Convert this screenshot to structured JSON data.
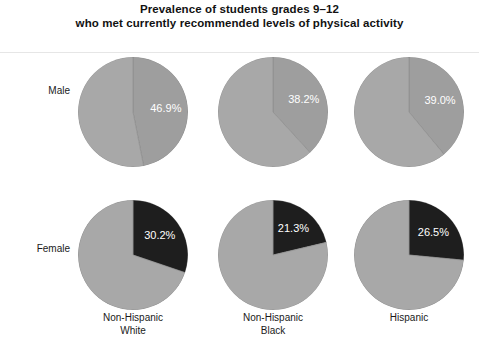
{
  "title": {
    "line1": "Prevalence of students grades 9–12",
    "line2": "who met currently recommended levels of physical activity"
  },
  "rows": [
    {
      "label": "Male"
    },
    {
      "label": "Female"
    }
  ],
  "columns": [
    {
      "line1": "Non-Hispanic",
      "line2": "White"
    },
    {
      "line1": "Non-Hispanic",
      "line2": "Black"
    },
    {
      "line1": "Hispanic",
      "line2": ""
    }
  ],
  "colors": {
    "slice_highlight_male": "#9e9e9e",
    "slice_highlight_female": "#1e1e1e",
    "slice_remainder": "#a8a8a8",
    "slice_outline": "#8a8a8a",
    "label_text": "#ffffff",
    "title_text": "#121212"
  },
  "cells": [
    {
      "row": "Male",
      "column": "Non-Hispanic White",
      "value_label": "46.9%"
    },
    {
      "row": "Male",
      "column": "Non-Hispanic Black",
      "value_label": "38.2%"
    },
    {
      "row": "Male",
      "column": "Hispanic",
      "value_label": "39.0%"
    },
    {
      "row": "Female",
      "column": "Non-Hispanic White",
      "value_label": "30.2%"
    },
    {
      "row": "Female",
      "column": "Non-Hispanic Black",
      "value_label": "21.3%"
    },
    {
      "row": "Female",
      "column": "Hispanic",
      "value_label": "26.5%"
    }
  ],
  "chart_data": {
    "type": "pie",
    "title": "Prevalence of students grades 9–12 who met currently recommended levels of physical activity",
    "subtitle": "",
    "xlabel": "",
    "ylabel": "",
    "units": "percent",
    "grid": false,
    "legend": "none",
    "layout": {
      "rows": 2,
      "cols": 3,
      "row_labels": [
        "Male",
        "Female"
      ],
      "col_labels": [
        "Non-Hispanic White",
        "Non-Hispanic Black",
        "Hispanic"
      ]
    },
    "panels": [
      {
        "row": "Male",
        "column": "Non-Hispanic White",
        "slices": [
          {
            "name": "Met recommended levels",
            "value": 46.9,
            "label": "46.9%",
            "color": "#9e9e9e"
          },
          {
            "name": "Did not meet",
            "value": 53.1,
            "label": "",
            "color": "#a8a8a8"
          }
        ]
      },
      {
        "row": "Male",
        "column": "Non-Hispanic Black",
        "slices": [
          {
            "name": "Met recommended levels",
            "value": 38.2,
            "label": "38.2%",
            "color": "#9e9e9e"
          },
          {
            "name": "Did not meet",
            "value": 61.8,
            "label": "",
            "color": "#a8a8a8"
          }
        ]
      },
      {
        "row": "Male",
        "column": "Hispanic",
        "slices": [
          {
            "name": "Met recommended levels",
            "value": 39.0,
            "label": "39.0%",
            "color": "#9e9e9e"
          },
          {
            "name": "Did not meet",
            "value": 61.0,
            "label": "",
            "color": "#a8a8a8"
          }
        ]
      },
      {
        "row": "Female",
        "column": "Non-Hispanic White",
        "slices": [
          {
            "name": "Met recommended levels",
            "value": 30.2,
            "label": "30.2%",
            "color": "#1e1e1e"
          },
          {
            "name": "Did not meet",
            "value": 69.8,
            "label": "",
            "color": "#a8a8a8"
          }
        ]
      },
      {
        "row": "Female",
        "column": "Non-Hispanic Black",
        "slices": [
          {
            "name": "Met recommended levels",
            "value": 21.3,
            "label": "21.3%",
            "color": "#1e1e1e"
          },
          {
            "name": "Did not meet",
            "value": 78.7,
            "label": "",
            "color": "#a8a8a8"
          }
        ]
      },
      {
        "row": "Female",
        "column": "Hispanic",
        "slices": [
          {
            "name": "Met recommended levels",
            "value": 26.5,
            "label": "26.5%",
            "color": "#1e1e1e"
          },
          {
            "name": "Did not meet",
            "value": 73.5,
            "label": "",
            "color": "#a8a8a8"
          }
        ]
      }
    ]
  }
}
